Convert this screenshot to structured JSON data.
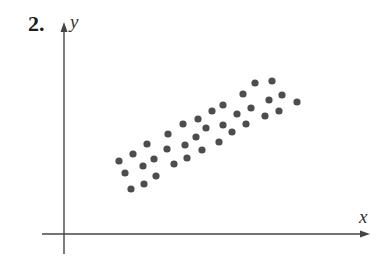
{
  "problem": {
    "number_label": "2."
  },
  "colors": {
    "axis": "#444444",
    "dot": "#4d4d4d",
    "text": "#1a1a1a"
  },
  "chart_data": {
    "type": "scatter",
    "title": "",
    "xlabel": "x",
    "ylabel": "y",
    "grid": false,
    "legend": null,
    "axis_ticks": "none",
    "pixel_frame": {
      "origin": [
        64,
        234
      ],
      "x_axis_end": [
        370,
        234
      ],
      "y_axis_end": [
        64,
        22
      ]
    },
    "points_px": [
      [
        119,
        161
      ],
      [
        133,
        154
      ],
      [
        147,
        144
      ],
      [
        125,
        173
      ],
      [
        143,
        166
      ],
      [
        154,
        159
      ],
      [
        131,
        189
      ],
      [
        144,
        184
      ],
      [
        156,
        176
      ],
      [
        168,
        134
      ],
      [
        167,
        149
      ],
      [
        174,
        164
      ],
      [
        183,
        124
      ],
      [
        185,
        145
      ],
      [
        187,
        158
      ],
      [
        198,
        119
      ],
      [
        196,
        137
      ],
      [
        202,
        150
      ],
      [
        206,
        128
      ],
      [
        212,
        111
      ],
      [
        223,
        105
      ],
      [
        223,
        125
      ],
      [
        219,
        142
      ],
      [
        232,
        132
      ],
      [
        237,
        114
      ],
      [
        243,
        94
      ],
      [
        246,
        124
      ],
      [
        251,
        108
      ],
      [
        255,
        83
      ],
      [
        272,
        81
      ],
      [
        269,
        100
      ],
      [
        282,
        95
      ],
      [
        265,
        116
      ],
      [
        279,
        111
      ],
      [
        297,
        102
      ]
    ],
    "points": [
      {
        "x": 55,
        "y": 73
      },
      {
        "x": 69,
        "y": 80
      },
      {
        "x": 83,
        "y": 90
      },
      {
        "x": 61,
        "y": 61
      },
      {
        "x": 79,
        "y": 68
      },
      {
        "x": 90,
        "y": 75
      },
      {
        "x": 67,
        "y": 45
      },
      {
        "x": 80,
        "y": 50
      },
      {
        "x": 92,
        "y": 58
      },
      {
        "x": 104,
        "y": 100
      },
      {
        "x": 103,
        "y": 85
      },
      {
        "x": 110,
        "y": 70
      },
      {
        "x": 119,
        "y": 110
      },
      {
        "x": 121,
        "y": 89
      },
      {
        "x": 123,
        "y": 76
      },
      {
        "x": 134,
        "y": 115
      },
      {
        "x": 132,
        "y": 97
      },
      {
        "x": 138,
        "y": 84
      },
      {
        "x": 142,
        "y": 106
      },
      {
        "x": 148,
        "y": 123
      },
      {
        "x": 159,
        "y": 129
      },
      {
        "x": 159,
        "y": 109
      },
      {
        "x": 155,
        "y": 92
      },
      {
        "x": 168,
        "y": 102
      },
      {
        "x": 173,
        "y": 120
      },
      {
        "x": 179,
        "y": 140
      },
      {
        "x": 182,
        "y": 110
      },
      {
        "x": 187,
        "y": 126
      },
      {
        "x": 191,
        "y": 151
      },
      {
        "x": 208,
        "y": 153
      },
      {
        "x": 205,
        "y": 134
      },
      {
        "x": 218,
        "y": 139
      },
      {
        "x": 201,
        "y": 118
      },
      {
        "x": 215,
        "y": 123
      },
      {
        "x": 233,
        "y": 132
      }
    ],
    "dot_radius_px": 3.6
  }
}
